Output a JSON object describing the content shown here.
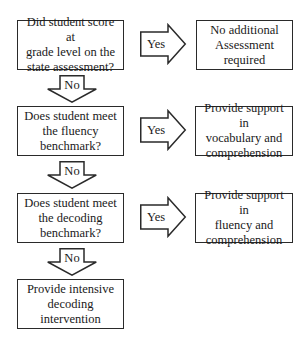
{
  "flowchart": {
    "decisions": [
      {
        "id": "q1",
        "lines": [
          "Did student score at",
          "grade level on the",
          "state assessment?"
        ],
        "yes_label": "Yes",
        "no_label": "No",
        "outcome": {
          "lines": [
            "No additional",
            "Assessment",
            "required"
          ]
        }
      },
      {
        "id": "q2",
        "lines": [
          "Does student meet",
          "the fluency",
          "benchmark?"
        ],
        "yes_label": "Yes",
        "no_label": "No",
        "outcome": {
          "lines": [
            "Provide support in",
            "vocabulary and",
            "comprehension"
          ]
        }
      },
      {
        "id": "q3",
        "lines": [
          "Does student meet",
          "the decoding",
          "benchmark?"
        ],
        "yes_label": "Yes",
        "no_label": "No",
        "outcome": {
          "lines": [
            "Provide support in",
            "fluency and",
            "comprehension"
          ]
        }
      }
    ],
    "final": {
      "lines": [
        "Provide intensive",
        "decoding",
        "intervention"
      ]
    }
  },
  "colors": {
    "stroke": "#2a2a2a",
    "fill": "#ffffff",
    "text": "#1a1a1a"
  }
}
